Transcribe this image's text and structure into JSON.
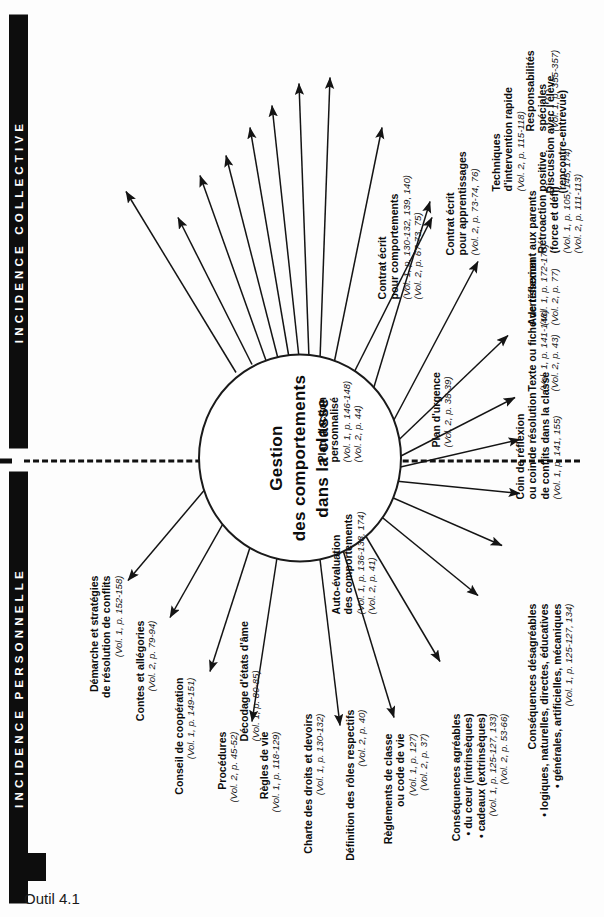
{
  "caption": "Outil 4.1",
  "bands": {
    "personnelle": "INCIDENCE PERSONNELLE",
    "collective": "INCIDENCE COLLECTIVE"
  },
  "core": {
    "line1": "Gestion",
    "line2": "des comportements",
    "line3": "dans la classe"
  },
  "colors": {
    "band_background": "#0d0d0d",
    "band_text": "#ffffff",
    "ink": "#111111",
    "page": "#ffffff"
  },
  "collective_items": [
    {
      "title": [
        "Démarche et stratégies",
        "de résolution de conflits"
      ],
      "refs": [
        "(Vol. 1, p. 152-158)"
      ]
    },
    {
      "title": [
        "Contes et allégories"
      ],
      "refs": [
        "(Vol. 2, p. 79-94)"
      ]
    },
    {
      "title": [
        "Conseil de coopération"
      ],
      "refs": [
        "(Vol. 1, p. 149-151)"
      ]
    },
    {
      "title": [
        "Procédures"
      ],
      "refs": [
        "(Vol. 2, p. 45-52)"
      ]
    },
    {
      "title": [
        "Règles de vie"
      ],
      "refs": [
        "(Vol. 1, p. 118-129)"
      ]
    },
    {
      "title": [
        "Charte des droits et devoirs"
      ],
      "refs": [
        "(Vol. 1, p. 130-132)"
      ]
    },
    {
      "title": [
        "Définition des rôles respectifs"
      ],
      "refs": [
        "(Vol. 2, p. 40)"
      ]
    },
    {
      "title": [
        "Règlements de classe",
        "ou code de vie"
      ],
      "refs": [
        "(Vol. 1, p. 127)",
        "(Vol. 2, p. 37)"
      ]
    },
    {
      "title": [
        "Conséquences agréables"
      ],
      "bullets": [
        "• du cœur (intrinsèques)",
        "• cadeaux (extrinsèques)"
      ],
      "refs": [
        "(Vol. 1, p. 125-127, 133)",
        "(Vol. 2, p. 53-66)"
      ]
    },
    {
      "title": [
        "Conséquences désagréables"
      ],
      "bullets": [
        "• logiques, naturelles, directes, éducatives",
        "• générales, artificielles, mécaniques"
      ],
      "refs": [
        "(Vol. 1, p. 125-127, 134)"
      ]
    },
    {
      "title": [
        "Auto-évaluation",
        "des comportements"
      ],
      "refs": [
        "(Vol. 1, p. 136-138, 174)",
        "(Vol. 2, p. 41)"
      ]
    },
    {
      "title": [
        "Décodage d'états d'âme"
      ],
      "refs": [
        "(Vol. 1, p. 80-85)"
      ]
    }
  ],
  "personal_items": [
    {
      "title": [
        "Plan d'action",
        "personnalisé"
      ],
      "refs": [
        "(Vol. 1, p. 146-148)",
        "(Vol. 2, p. 44)"
      ]
    },
    {
      "title": [
        "Contrat écrit",
        "pour comportements"
      ],
      "refs": [
        "(Vol. 1, p. 130-132, 139, 140)",
        "(Vol. 2, p. 67-73, 75)"
      ]
    },
    {
      "title": [
        "Contrat écrit",
        "pour apprentissages"
      ],
      "refs": [
        "(Vol. 2, p. 73-74, 76)"
      ]
    },
    {
      "title": [
        "Techniques",
        "d'intervention rapide"
      ],
      "refs": [
        "(Vol. 2, p. 115-118)"
      ]
    },
    {
      "title": [
        "Responsabilités",
        "spéciales"
      ],
      "refs": [
        "(Vol. 1, p. 355-357)"
      ]
    },
    {
      "title": [
        "Discussion avec l'élève",
        "(rencontre-entrevue)"
      ],
      "refs": []
    },
    {
      "title": [
        "Rétroaction positive",
        "(force et défi)"
      ],
      "refs": [
        "(Vol. 1, p. 105, 145, 174)",
        "(Vol. 2, p. 111-113)"
      ]
    },
    {
      "title": [
        "Avertissement aux parents"
      ],
      "refs": [
        "(Vol. 1, p. 172-173)",
        "(Vol. 2, p. 77)"
      ]
    },
    {
      "title": [
        "Texte ou fiche de réflexion"
      ],
      "refs": [
        "(Vol. 1, p. 141-148)",
        "(Vol. 2, p. 43)"
      ]
    },
    {
      "title": [
        "Coin de réflexion",
        "ou coin de résolution",
        "de conflits dans la classe"
      ],
      "refs": [
        "(Vol. 1, p. 141, 155)"
      ]
    },
    {
      "title": [
        "Plan d'urgence"
      ],
      "refs": [
        "(Vol. 2, p. 38-39)"
      ]
    }
  ]
}
